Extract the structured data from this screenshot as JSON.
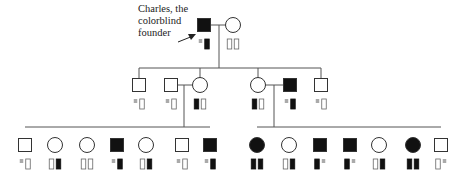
{
  "annotation": {
    "lines": [
      "Charles, the",
      "colorblind",
      "founder"
    ]
  },
  "colors": {
    "affected": "#111111",
    "unaffected_fill": "#ffffff",
    "stroke": "#333333",
    "y_chromosome": "#aaaaaa",
    "x_mutant": "#111111",
    "x_normal": "#ffffff"
  },
  "legend_semantics": {
    "square": "male",
    "circle": "female",
    "filled": "colorblind (affected)",
    "tall_filled_bar": "X chromosome carrying colorblindness allele",
    "tall_open_bar": "normal X chromosome",
    "small_gray_square": "Y chromosome"
  },
  "generations": [
    {
      "id": "I",
      "individuals": [
        {
          "sex": "male",
          "affected": true,
          "x": 204,
          "y": 25,
          "chromosomes": [
            "Y",
            "Xc"
          ],
          "name": "Charles"
        },
        {
          "sex": "female",
          "affected": false,
          "x": 233,
          "y": 25,
          "chromosomes": [
            "X",
            "X"
          ]
        }
      ]
    },
    {
      "id": "II",
      "individuals": [
        {
          "sex": "male",
          "affected": false,
          "x": 139,
          "y": 85,
          "chromosomes": [
            "Y",
            "X"
          ]
        },
        {
          "sex": "male",
          "affected": false,
          "x": 171,
          "y": 85,
          "chromosomes": [
            "Y",
            "X"
          ],
          "spouse_in": true
        },
        {
          "sex": "female",
          "affected": false,
          "x": 200,
          "y": 85,
          "chromosomes": [
            "Xc",
            "X"
          ]
        },
        {
          "sex": "female",
          "affected": false,
          "x": 258,
          "y": 85,
          "chromosomes": [
            "Xc",
            "X"
          ]
        },
        {
          "sex": "male",
          "affected": true,
          "x": 290,
          "y": 85,
          "chromosomes": [
            "Y",
            "Xc"
          ],
          "spouse_in": true
        },
        {
          "sex": "male",
          "affected": false,
          "x": 321,
          "y": 85,
          "chromosomes": [
            "Y",
            "X"
          ]
        }
      ]
    },
    {
      "id": "III",
      "individuals": [
        {
          "sex": "male",
          "affected": false,
          "x": 25,
          "y": 145,
          "chromosomes": [
            "Y",
            "X"
          ]
        },
        {
          "sex": "female",
          "affected": false,
          "x": 55,
          "y": 145,
          "chromosomes": [
            "X",
            "Xc"
          ]
        },
        {
          "sex": "female",
          "affected": false,
          "x": 87,
          "y": 145,
          "chromosomes": [
            "X",
            "X"
          ]
        },
        {
          "sex": "male",
          "affected": true,
          "x": 117,
          "y": 145,
          "chromosomes": [
            "Y",
            "Xc"
          ]
        },
        {
          "sex": "female",
          "affected": false,
          "x": 146,
          "y": 145,
          "chromosomes": [
            "X",
            "Xc"
          ]
        },
        {
          "sex": "male",
          "affected": false,
          "x": 182,
          "y": 145,
          "chromosomes": [
            "Y",
            "X"
          ]
        },
        {
          "sex": "male",
          "affected": true,
          "x": 210,
          "y": 145,
          "chromosomes": [
            "Y",
            "Xc"
          ]
        },
        {
          "sex": "female",
          "affected": true,
          "x": 257,
          "y": 145,
          "chromosomes": [
            "Xc",
            "Xc"
          ]
        },
        {
          "sex": "female",
          "affected": false,
          "x": 289,
          "y": 145,
          "chromosomes": [
            "X",
            "Xc"
          ]
        },
        {
          "sex": "male",
          "affected": true,
          "x": 320,
          "y": 145,
          "chromosomes": [
            "Xc",
            "Y"
          ]
        },
        {
          "sex": "male",
          "affected": true,
          "x": 350,
          "y": 145,
          "chromosomes": [
            "Xc",
            "Y"
          ]
        },
        {
          "sex": "female",
          "affected": false,
          "x": 379,
          "y": 145,
          "chromosomes": [
            "X",
            "Xc"
          ]
        },
        {
          "sex": "female",
          "affected": true,
          "x": 413,
          "y": 145,
          "chromosomes": [
            "Xc",
            "Xc"
          ]
        },
        {
          "sex": "male",
          "affected": false,
          "x": 441,
          "y": 145,
          "chromosomes": [
            "X",
            "Y"
          ]
        }
      ]
    }
  ],
  "lines": [
    {
      "x1": 210,
      "y1": 25,
      "x2": 226,
      "y2": 25
    },
    {
      "x1": 219,
      "y1": 25,
      "x2": 219,
      "y2": 68
    },
    {
      "x1": 139,
      "y1": 68,
      "x2": 321,
      "y2": 68
    },
    {
      "x1": 139,
      "y1": 68,
      "x2": 139,
      "y2": 78
    },
    {
      "x1": 200,
      "y1": 68,
      "x2": 200,
      "y2": 78
    },
    {
      "x1": 258,
      "y1": 68,
      "x2": 258,
      "y2": 78
    },
    {
      "x1": 321,
      "y1": 68,
      "x2": 321,
      "y2": 78
    },
    {
      "x1": 177,
      "y1": 85,
      "x2": 193,
      "y2": 85
    },
    {
      "x1": 184,
      "y1": 85,
      "x2": 184,
      "y2": 127
    },
    {
      "x1": 25,
      "y1": 127,
      "x2": 210,
      "y2": 127
    },
    {
      "x1": 265,
      "y1": 85,
      "x2": 284,
      "y2": 85
    },
    {
      "x1": 274,
      "y1": 85,
      "x2": 274,
      "y2": 127
    },
    {
      "x1": 257,
      "y1": 127,
      "x2": 441,
      "y2": 127
    }
  ]
}
